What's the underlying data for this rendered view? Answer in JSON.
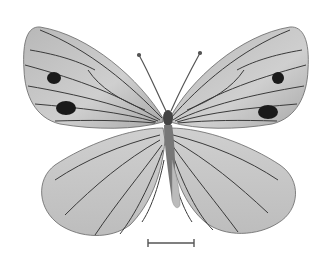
{
  "image": {
    "subject": "butterfly specimen, dorsal view, grayscale",
    "background_color": "#ffffff",
    "wing_fill": "#c4c4c4",
    "wing_fill_light": "#d6d6d6",
    "vein_color": "#3a3a3a",
    "spot_color": "#1a1a1a",
    "body_color": "#555555"
  },
  "scale_bar": {
    "color": "#555555",
    "x1": 148,
    "x2": 194,
    "y": 243
  }
}
